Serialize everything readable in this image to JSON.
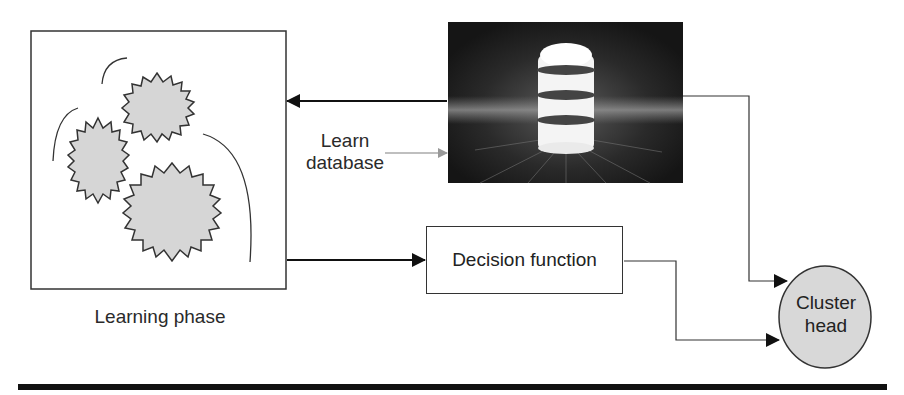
{
  "diagram": {
    "learning_phase": {
      "label": "Learning phase",
      "cluster_count": 3
    },
    "database": {
      "icon": "database-icon",
      "label_line1": "Learn",
      "label_line2": "database"
    },
    "decision_function": {
      "label": "Decision function"
    },
    "cluster_head": {
      "label_line1": "Cluster",
      "label_line2": "head",
      "fill": "#d8d8d8"
    },
    "colors": {
      "line": "#333333",
      "arrow_gray": "#9a9a9a",
      "cluster_fill": "#d6d6d6",
      "db_background": "#1c1c1c"
    },
    "edges": [
      {
        "from": "database",
        "to": "learning-phase",
        "style": "solid-black"
      },
      {
        "from": "learn-database-label",
        "to": "database",
        "style": "gray"
      },
      {
        "from": "learning-phase",
        "to": "decision-function",
        "style": "solid-black"
      },
      {
        "from": "database",
        "to": "cluster-head",
        "style": "thin"
      },
      {
        "from": "decision-function",
        "to": "cluster-head",
        "style": "thin"
      }
    ]
  }
}
